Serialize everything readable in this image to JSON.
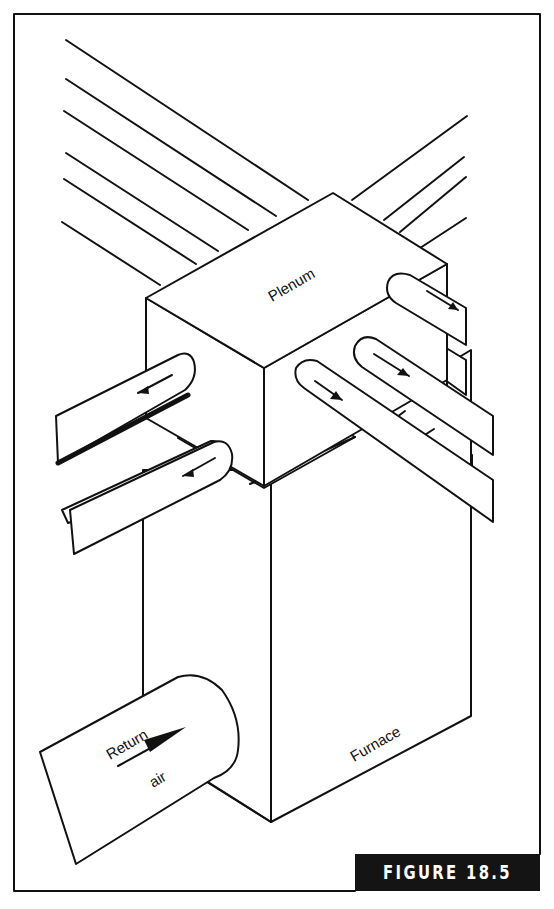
{
  "figure": {
    "caption": "FIGURE 18.5",
    "caption_bg": "#141414",
    "caption_fg": "#ffffff"
  },
  "labels": {
    "plenum": "Plenum",
    "furnace": "Furnace",
    "return_line1": "Return",
    "return_line2": "air"
  },
  "components": [
    {
      "name": "plenum",
      "description": "Box above furnace distributing air"
    },
    {
      "name": "furnace",
      "description": "Vertical box under plenum"
    },
    {
      "name": "return-air-duct",
      "description": "Round duct entering furnace side"
    },
    {
      "name": "supply-ducts-left",
      "count": 2,
      "flow": "away from plenum"
    },
    {
      "name": "supply-ducts-right",
      "count": 3,
      "flow": "away from plenum"
    },
    {
      "name": "trunk-lines-back",
      "count": 10
    }
  ]
}
